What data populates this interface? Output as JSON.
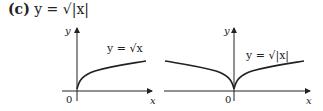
{
  "heading": {
    "label": "(c)",
    "equation": "y = √|x|"
  },
  "graphs": [
    {
      "curve_label": "y = √x",
      "origin": "0",
      "x_axis": "x",
      "y_axis": "y"
    },
    {
      "curve_label": "y = √|x|",
      "origin": "0",
      "x_axis": "x",
      "y_axis": "y"
    }
  ]
}
